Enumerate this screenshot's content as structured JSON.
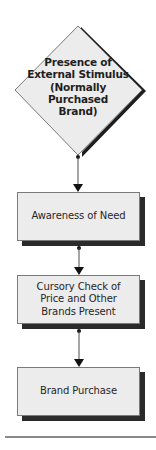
{
  "diagram": {
    "type": "flowchart",
    "start": {
      "shape": "diamond",
      "lines": [
        "Presence of",
        "External Stimulus",
        "(Normally",
        "Purchased",
        "Brand)"
      ]
    },
    "steps": [
      {
        "shape": "rectangle",
        "lines": [
          "Awareness of Need"
        ]
      },
      {
        "shape": "rectangle",
        "lines": [
          "Cursory Check of",
          "Price and Other",
          "Brands Present"
        ]
      },
      {
        "shape": "rectangle",
        "lines": [
          "Brand Purchase"
        ]
      }
    ],
    "colors": {
      "shape_fill": "#ececec",
      "shape_border": "#7a7a7a",
      "shadow": "#2a2a2a",
      "connector": "#4a4a4a",
      "arrowhead": "#111111",
      "rule": "#8a8a8a"
    }
  }
}
